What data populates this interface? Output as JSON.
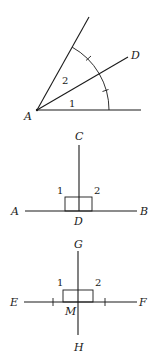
{
  "figures": [
    {
      "id": "angle-bisector",
      "description": "Ray AD bisects the angle at A; arc with tick marks shows angle 1 = angle 2",
      "vertex": "A",
      "points": {
        "A": "A",
        "D": "D"
      },
      "angles": [
        "1",
        "2"
      ],
      "labels": {
        "A": "A",
        "D": "D",
        "angle1": "1",
        "angle2": "2"
      }
    },
    {
      "id": "perpendicular-at-D",
      "description": "CD perpendicular to AB at D forming right angles 1 and 2",
      "labels": {
        "C": "C",
        "A": "A",
        "B": "B",
        "D": "D",
        "angle1": "1",
        "angle2": "2"
      }
    },
    {
      "id": "perpendicular-bisector",
      "description": "GH is the perpendicular bisector of EF at midpoint M; tick marks show EM = MF",
      "labels": {
        "G": "G",
        "E": "E",
        "F": "F",
        "M": "M",
        "H": "H",
        "angle1": "1",
        "angle2": "2"
      }
    }
  ],
  "colors": {
    "stroke": "#1a1a1a",
    "background": "#ffffff"
  }
}
